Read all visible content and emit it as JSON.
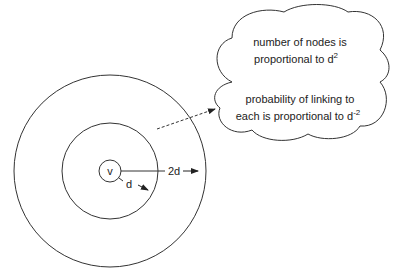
{
  "diagram": {
    "center_node": {
      "label": "v"
    },
    "inner_radius_label": "d",
    "outer_radius_label": "2d",
    "callout": {
      "line1": "number of nodes is",
      "line2": "proportional to d",
      "line2_sup": "2",
      "line3": "probability of linking to",
      "line4": "each is proportional to d",
      "line4_sup": "-2"
    },
    "colors": {
      "stroke": "#333333",
      "background": "#ffffff",
      "text": "#222222"
    }
  }
}
